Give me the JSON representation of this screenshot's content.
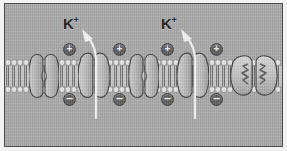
{
  "figure": {
    "background_color": "#a9a9a9",
    "border_color": "#4a4a4a",
    "page_color": "#f2f2f2"
  },
  "membrane": {
    "name": "phospholipid-bilayer",
    "head_color": "#e2e2e2",
    "tail_color": "#7d7d7d",
    "top_y": 55,
    "height": 34
  },
  "ion_labels": [
    {
      "symbol": "K",
      "charge": "+",
      "x": 62,
      "y": 15
    },
    {
      "symbol": "K",
      "charge": "+",
      "x": 160,
      "y": 15
    }
  ],
  "charges": {
    "outside_symbol": "+",
    "inside_symbol": "–",
    "positive_positions": [
      58,
      108,
      156,
      205
    ],
    "negative_positions": [
      58,
      108,
      156,
      205
    ],
    "positive_y": 39,
    "negative_y": 89,
    "badge_color": "#5b5b5b",
    "label_color": "#f4f4f4"
  },
  "proteins": [
    {
      "name": "channel-protein-closed-1",
      "state": "closed",
      "x": 24,
      "width": 30
    },
    {
      "name": "potassium-channel-open-1",
      "state": "open",
      "x": 73,
      "width": 32
    },
    {
      "name": "channel-protein-closed-2",
      "state": "closed",
      "x": 124,
      "width": 30
    },
    {
      "name": "potassium-channel-open-2",
      "state": "open",
      "x": 172,
      "width": 32
    },
    {
      "name": "transporter-protein-folded",
      "state": "folded",
      "x": 225,
      "width": 48
    }
  ],
  "flux_arrows": [
    {
      "name": "potassium-efflux-arrow-1",
      "x": 90,
      "direction": "outward"
    },
    {
      "name": "potassium-efflux-arrow-2",
      "x": 189,
      "direction": "outward"
    }
  ],
  "arrow_color": "#f7f7f7"
}
